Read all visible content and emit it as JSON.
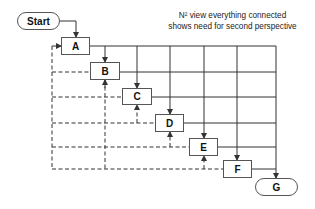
{
  "diagram": {
    "caption_line1": "N² view everything connected",
    "caption_line2": "shows need for second perspective",
    "nodes": [
      {
        "id": "start",
        "label": "Start",
        "shape": "terminal"
      },
      {
        "id": "A",
        "label": "A",
        "shape": "process"
      },
      {
        "id": "B",
        "label": "B",
        "shape": "process"
      },
      {
        "id": "C",
        "label": "C",
        "shape": "process"
      },
      {
        "id": "D",
        "label": "D",
        "shape": "process"
      },
      {
        "id": "E",
        "label": "E",
        "shape": "process"
      },
      {
        "id": "F",
        "label": "F",
        "shape": "process"
      },
      {
        "id": "G",
        "label": "G",
        "shape": "terminal"
      }
    ],
    "edges": {
      "solid_feedforward": "each node connects forward to every later node (N² grid)",
      "dashed_feedback": "each later node feeds back to earlier nodes"
    },
    "colors": {
      "line": "#333333",
      "box_border": "#555555",
      "text": "#111111"
    }
  }
}
